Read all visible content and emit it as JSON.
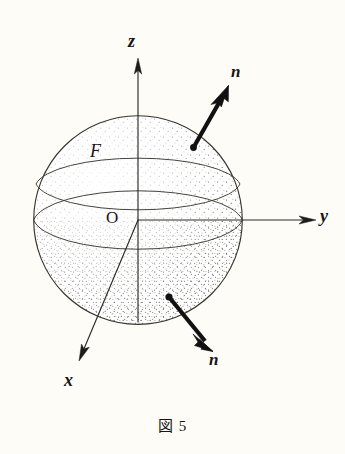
{
  "figure": {
    "caption": "図 5",
    "background_color": "#fdfcf7",
    "ink_color": "#2b2a28",
    "vector_color": "#111111",
    "width": 345,
    "height": 454
  },
  "labels": {
    "axis_z": "z",
    "axis_y": "y",
    "axis_x": "x",
    "origin": "O",
    "surface": "F",
    "normal_upper": "n",
    "normal_lower": "n"
  },
  "geometry": {
    "sphere": {
      "cx": 138,
      "cy": 220,
      "r": 105
    },
    "equator": {
      "cx": 138,
      "cy": 220,
      "rx": 105,
      "ry": 33
    },
    "tropic": {
      "cx": 138,
      "cy": 188,
      "rx": 103,
      "ry": 30
    },
    "axis_z": {
      "x1": 138,
      "y1": 322,
      "x2": 138,
      "y2": 62
    },
    "axis_y": {
      "x1": 138,
      "y1": 220,
      "x2": 316,
      "y2": 220
    },
    "axis_x": {
      "x1": 138,
      "y1": 220,
      "x2": 80,
      "y2": 358
    },
    "normal_upper": {
      "x1": 193,
      "y1": 148,
      "x2": 228,
      "y2": 87
    },
    "normal_lower": {
      "x1": 169,
      "y1": 297,
      "x2": 212,
      "y2": 351
    }
  },
  "label_positions": {
    "axis_z": {
      "left": 128,
      "top": 32
    },
    "axis_y": {
      "left": 320,
      "top": 208
    },
    "axis_x": {
      "left": 64,
      "top": 372
    },
    "origin": {
      "left": 106,
      "top": 209
    },
    "surface": {
      "left": 90,
      "top": 142
    },
    "normal_upper": {
      "left": 231,
      "top": 62
    },
    "normal_lower": {
      "left": 209,
      "top": 350
    }
  }
}
